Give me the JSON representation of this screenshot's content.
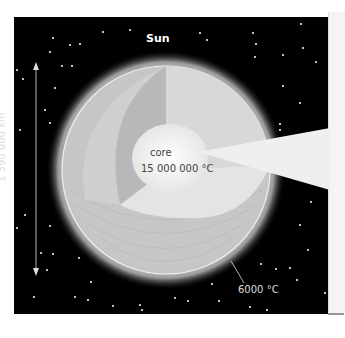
{
  "title": "Sun",
  "core_label": "core",
  "core_temperature": "15 000 000 °C",
  "surface_temperature": "6000 °C",
  "diameter": "1 390 000 km",
  "colors": {
    "background": "#000000",
    "sun_surface": "#c8c8c8",
    "core": "#f5f5f5"
  }
}
